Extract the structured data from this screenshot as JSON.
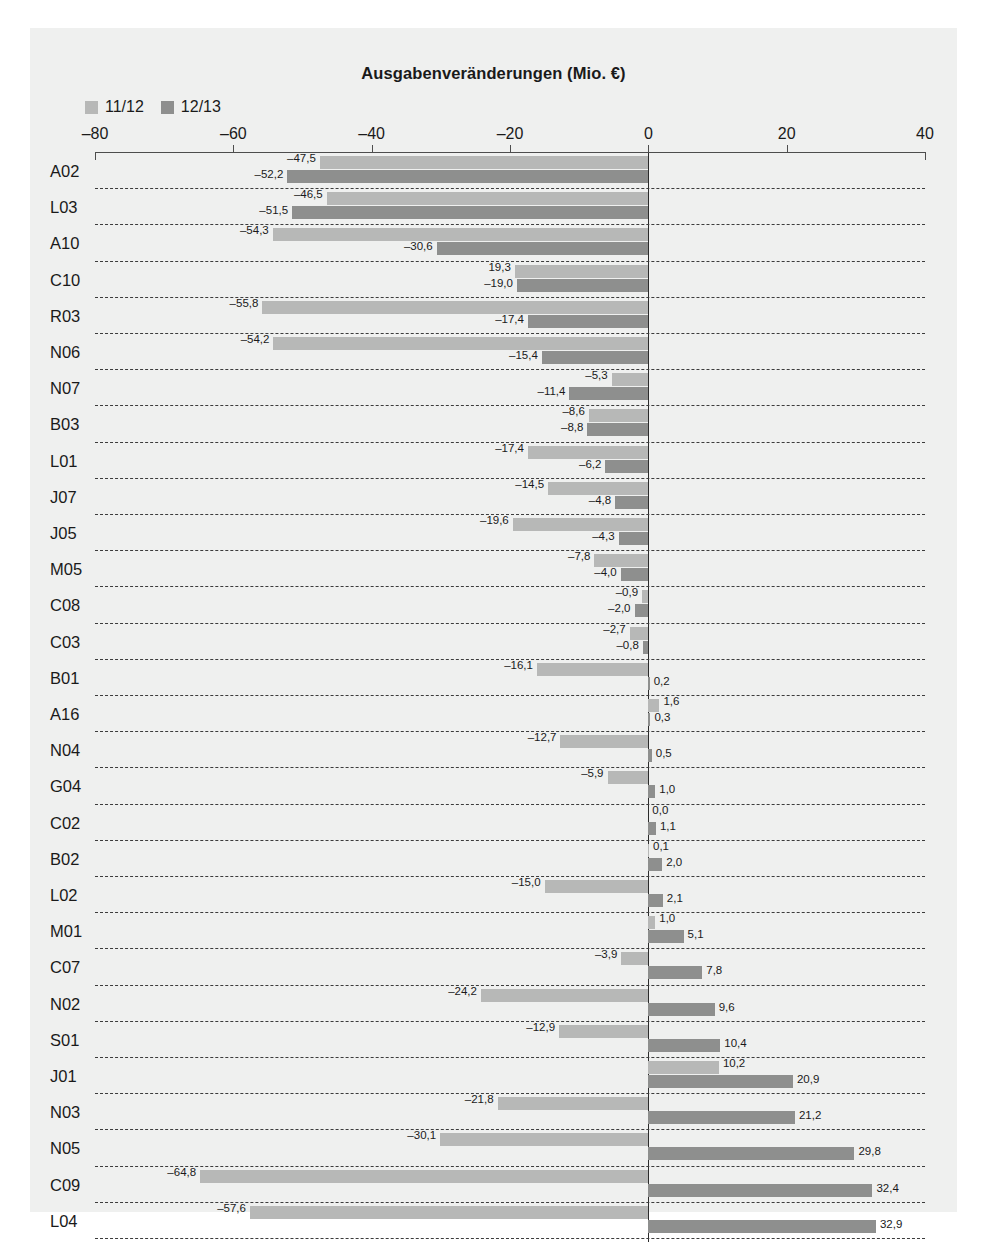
{
  "chart_data": {
    "type": "bar",
    "orientation": "horizontal",
    "title": "Ausgabenveränderungen (Mio. €)",
    "xlabel": "",
    "ylabel": "",
    "xlim": [
      -80,
      40
    ],
    "xticks": [
      -80,
      -60,
      -40,
      -20,
      0,
      20,
      40
    ],
    "xtick_labels": [
      "–80",
      "–60",
      "–40",
      "–20",
      "0",
      "20",
      "40"
    ],
    "grid": "horizontal-dashed",
    "legend_position": "top-left",
    "categories": [
      "A02",
      "L03",
      "A10",
      "C10",
      "R03",
      "N06",
      "N07",
      "B03",
      "L01",
      "J07",
      "J05",
      "M05",
      "C08",
      "C03",
      "B01",
      "A16",
      "N04",
      "G04",
      "C02",
      "B02",
      "L02",
      "M01",
      "C07",
      "N02",
      "S01",
      "J01",
      "N03",
      "N05",
      "C09",
      "L04"
    ],
    "series": [
      {
        "name": "11/12",
        "color": "#b7b8b7",
        "values": [
          -47.5,
          -46.5,
          -54.3,
          -19.3,
          -55.8,
          -54.2,
          -5.3,
          -8.6,
          -17.4,
          -14.5,
          -19.6,
          -7.8,
          -0.9,
          -2.7,
          -16.1,
          1.6,
          -12.7,
          -5.9,
          0.0,
          0.1,
          -15.0,
          1.0,
          -3.9,
          -24.2,
          -12.9,
          10.2,
          -21.8,
          -30.1,
          -64.8,
          -57.6
        ],
        "labels": [
          "–47,5",
          "–46,5",
          "–54,3",
          "19,3",
          "–55,8",
          "–54,2",
          "–5,3",
          "–8,6",
          "–17,4",
          "–14,5",
          "–19,6",
          "–7,8",
          "–0,9",
          "–2,7",
          "–16,1",
          "1,6",
          "–12,7",
          "–5,9",
          "0,0",
          "0,1",
          "–15,0",
          "1,0",
          "–3,9",
          "–24,2",
          "–12,9",
          "10,2",
          "–21,8",
          "–30,1",
          "–64,8",
          "–57,6"
        ]
      },
      {
        "name": "12/13",
        "color": "#8e8f8e",
        "values": [
          -52.2,
          -51.5,
          -30.6,
          -19.0,
          -17.4,
          -15.4,
          -11.4,
          -8.8,
          -6.2,
          -4.8,
          -4.3,
          -4.0,
          -2.0,
          -0.8,
          0.2,
          0.3,
          0.5,
          1.0,
          1.1,
          2.0,
          2.1,
          5.1,
          7.8,
          9.6,
          10.4,
          20.9,
          21.2,
          29.8,
          32.4,
          32.9
        ],
        "labels": [
          "–52,2",
          "–51,5",
          "–30,6",
          "–19,0",
          "–17,4",
          "–15,4",
          "–11,4",
          "–8,8",
          "–6,2",
          "–4,8",
          "–4,3",
          "–4,0",
          "–2,0",
          "–0,8",
          "0,2",
          "0,3",
          "0,5",
          "1,0",
          "1,1",
          "2,0",
          "2,1",
          "5,1",
          "7,8",
          "9,6",
          "10,4",
          "20,9",
          "21,2",
          "29,8",
          "32,4",
          "32,9"
        ]
      }
    ]
  },
  "legend": {
    "items": [
      {
        "label": "11/12",
        "color": "#b7b8b7"
      },
      {
        "label": "12/13",
        "color": "#8e8f8e"
      }
    ]
  },
  "colors": {
    "panel_background": "#eff0ef",
    "page_background": "#ffffff",
    "axis": "#4d4d4d",
    "zero_line": "#2b2b2b",
    "separator": "#3c3c3c",
    "text": "#1a1a1a",
    "series_11_12": "#b7b8b7",
    "series_12_13": "#8e8f8e"
  }
}
